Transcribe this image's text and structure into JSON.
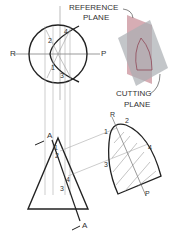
{
  "labels": {
    "reference_plane_1": "REFERENCE",
    "reference_plane_2": "PLANE",
    "cutting_plane_1": "CUTTING",
    "cutting_plane_2": "PLANE",
    "top_r": "R",
    "top_p": "P",
    "top_1": "1",
    "top_2": "2",
    "top_3": "3",
    "top_4": "4",
    "front_a_top": "A",
    "front_a_bottom": "A",
    "front_1": "1",
    "front_2": "2",
    "front_3": "3",
    "front_4": "4",
    "true_r": "R",
    "true_1": "1",
    "true_2": "2",
    "true_3": "3",
    "true_4": "4",
    "true_p": "P"
  },
  "colors": {
    "line": "#222222",
    "thin_line": "#888888",
    "reference_plane": "#c9919b",
    "cutting_plane": "#a9aeb2"
  }
}
